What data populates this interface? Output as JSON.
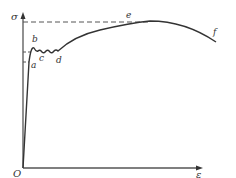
{
  "diagram": {
    "axes": {
      "y_label": "σ",
      "x_label": "ε",
      "origin_label": "O"
    },
    "points": {
      "a": "a",
      "b": "b",
      "c": "c",
      "d": "d",
      "e": "e",
      "f": "f"
    },
    "colors": {
      "curve": "#333333",
      "axis": "#555555",
      "dashed": "#555555",
      "background": "#ffffff"
    }
  }
}
